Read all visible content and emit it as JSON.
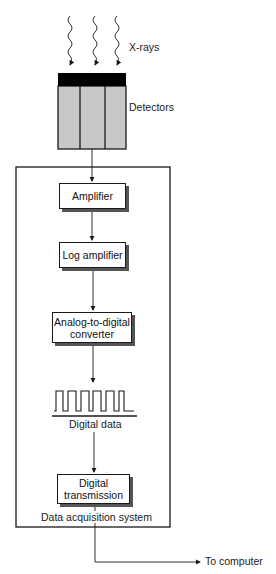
{
  "diagram": {
    "input_label": "X-rays",
    "detector_label": "Detectors",
    "detector_count": 3,
    "system_label": "Data acquisition system",
    "stages": [
      {
        "id": "amplifier",
        "label": "Amplifier"
      },
      {
        "id": "log-amplifier",
        "label": "Log amplifier"
      },
      {
        "id": "adc",
        "label": "Analog-to-digital converter",
        "line1": "Analog-to-digital",
        "line2": "converter"
      },
      {
        "id": "digital-data",
        "label": "Digital data"
      },
      {
        "id": "digital-transmission",
        "label": "Digital transmission",
        "line1": "Digital",
        "line2": "transmission"
      }
    ],
    "output_label": "To computer",
    "colors": {
      "line": "#1a1a1a",
      "detector_fill": "#c8c8c8",
      "detector_cap": "#000000",
      "shadow": "#555555"
    }
  }
}
